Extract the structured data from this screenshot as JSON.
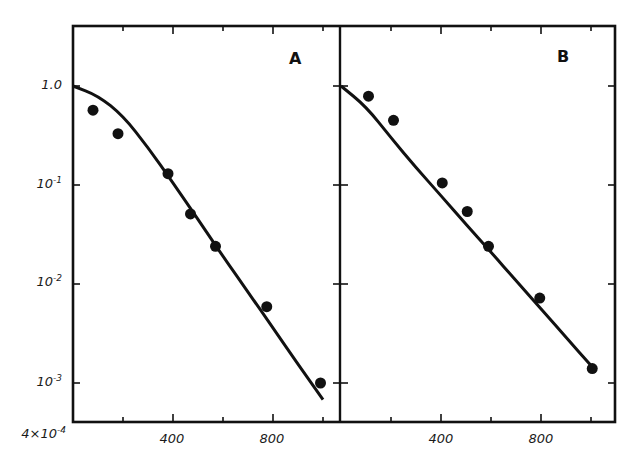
{
  "chart_data": [
    {
      "type": "scatter",
      "panel": "A",
      "title": "A",
      "xlabel": "",
      "ylabel": "",
      "yscale": "log",
      "xlim": [
        0,
        1070
      ],
      "ylim": [
        0.0004,
        3.0
      ],
      "xticks": [
        400,
        800
      ],
      "xtick_labels": [
        "400",
        "800"
      ],
      "yticks": [
        1.0,
        0.1,
        0.01,
        0.001,
        0.0004
      ],
      "ytick_labels": [
        "1.0",
        "10^-1",
        "10^-2",
        "10^-3",
        "4×10^-4"
      ],
      "grid": false,
      "series": [
        {
          "name": "data",
          "style": "filled-circle",
          "x": [
            80,
            180,
            380,
            470,
            570,
            775,
            990
          ],
          "y": [
            0.57,
            0.33,
            0.13,
            0.051,
            0.024,
            0.0059,
            0.001
          ]
        },
        {
          "name": "fit",
          "style": "line",
          "x": [
            0,
            100,
            200,
            300,
            400,
            500,
            600,
            700,
            800,
            900,
            1000
          ],
          "y": [
            1.0,
            0.8,
            0.5,
            0.24,
            0.105,
            0.045,
            0.019,
            0.0083,
            0.0036,
            0.00155,
            0.00068
          ]
        }
      ]
    },
    {
      "type": "scatter",
      "panel": "B",
      "title": "B",
      "xlabel": "",
      "ylabel": "",
      "yscale": "log",
      "xlim": [
        0,
        1070
      ],
      "ylim": [
        0.0004,
        3.0
      ],
      "xticks": [
        400,
        800
      ],
      "xtick_labels": [
        "400",
        "800"
      ],
      "grid": false,
      "series": [
        {
          "name": "data",
          "style": "filled-circle",
          "x": [
            110,
            210,
            405,
            505,
            590,
            795,
            1005
          ],
          "y": [
            0.79,
            0.45,
            0.105,
            0.054,
            0.024,
            0.0072,
            0.0014
          ]
        },
        {
          "name": "fit",
          "style": "line",
          "x": [
            0,
            100,
            200,
            300,
            400,
            500,
            600,
            700,
            800,
            900,
            1000
          ],
          "y": [
            1.0,
            0.62,
            0.3,
            0.15,
            0.078,
            0.04,
            0.021,
            0.0108,
            0.0056,
            0.0029,
            0.0015
          ]
        }
      ]
    }
  ],
  "labels": {
    "panel_a": "A",
    "panel_b": "B",
    "y_ticks": [
      "1.0",
      "10",
      "10",
      "10",
      "4×10"
    ],
    "y_exps": [
      "",
      "-1",
      "-2",
      "-3",
      "-4"
    ],
    "x_ticks_a": [
      "400",
      "800"
    ],
    "x_ticks_b": [
      "400",
      "800"
    ]
  }
}
